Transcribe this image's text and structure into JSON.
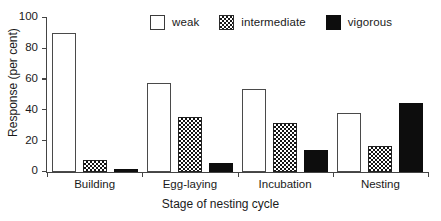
{
  "chart_data": {
    "type": "bar",
    "title": "",
    "xlabel": "Stage of nesting cycle",
    "ylabel": "Response (per cent)",
    "categories": [
      "Building",
      "Egg-laying",
      "Incubation",
      "Nesting"
    ],
    "series": [
      {
        "name": "weak",
        "values": [
          90,
          58,
          54,
          38
        ],
        "swatch": "open",
        "color": "#ffffff"
      },
      {
        "name": "intermediate",
        "values": [
          8,
          36,
          32,
          17
        ],
        "swatch": "checkered",
        "color": "#1a1a1a"
      },
      {
        "name": "vigorous",
        "values": [
          2,
          6,
          14,
          45
        ],
        "swatch": "solid",
        "color": "#0d0d0d"
      }
    ],
    "ylim": [
      0,
      100
    ],
    "yticks": [
      0,
      20,
      40,
      60,
      80,
      100
    ],
    "ytick_labels": [
      "0",
      "20",
      "40",
      "60",
      "80",
      "100"
    ],
    "grid": false,
    "legend_position": "top"
  },
  "legend": {
    "entries": [
      {
        "label": "weak"
      },
      {
        "label": "intermediate"
      },
      {
        "label": "vigorous"
      }
    ]
  },
  "axis": {
    "y_title": "Response (per cent)",
    "x_title": "Stage of nesting cycle"
  }
}
